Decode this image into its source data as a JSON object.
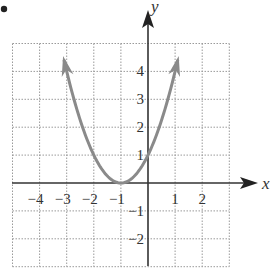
{
  "chart_data": {
    "type": "line",
    "title": "",
    "function": "y = (x + 1)^2",
    "xlabel": "x",
    "ylabel": "y",
    "xlim": [
      -5,
      3
    ],
    "ylim": [
      -3,
      5
    ],
    "grid": true,
    "grid_style": "dotted",
    "x_ticks": [
      "-4",
      "-3",
      "-2",
      "-1",
      "1",
      "2"
    ],
    "y_ticks": [
      "4",
      "3",
      "2",
      "1",
      "-1",
      "-2"
    ],
    "series": [
      {
        "name": "parabola",
        "color": "#8a8a8a",
        "x": [
          -3.1,
          -3,
          -2.5,
          -2,
          -1.5,
          -1,
          -0.5,
          0,
          0.5,
          1,
          1.1
        ],
        "y": [
          4.41,
          4,
          2.25,
          1,
          0.25,
          0,
          0.25,
          1,
          2.25,
          4,
          4.41
        ],
        "vertex": [
          -1,
          0
        ],
        "arrows_at_ends": true
      }
    ],
    "bullet_marker": true
  },
  "labels": {
    "x_axis": "x",
    "y_axis": "y"
  },
  "colors": {
    "axis": "#333333",
    "grid": "#9a9a9a",
    "curve": "#8a8a8a"
  }
}
